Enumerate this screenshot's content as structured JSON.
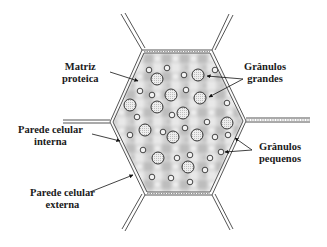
{
  "diagram": {
    "type": "plant cell cross-section (hexagonal cell with starch granules)",
    "colors": {
      "wall": "#555555",
      "matrix_fill": "#cfcfcf",
      "granule_fill": "#e4e4e4",
      "granule_stroke": "#333333",
      "text": "#1a1a1a"
    }
  },
  "labels": {
    "matriz_proteica": {
      "line1": "Matriz",
      "line2": "proteica"
    },
    "granulos_grandes": {
      "line1": "Grânulos",
      "line2": "grandes"
    },
    "parede_interna": {
      "line1": "Parede celular",
      "line2": "interna"
    },
    "granulos_pequenos": {
      "line1": "Grânulos",
      "line2": "pequenos"
    },
    "parede_externa": {
      "line1": "Parede celular",
      "line2": "externa"
    }
  }
}
